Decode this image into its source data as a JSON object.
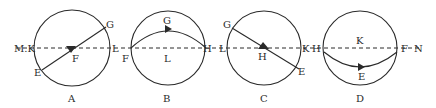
{
  "figure": {
    "panels": [
      {
        "id": "A",
        "caption": "A",
        "cx": 72,
        "cy": 48,
        "r": 38
      },
      {
        "id": "B",
        "caption": "B",
        "cx": 167,
        "cy": 48,
        "r": 37
      },
      {
        "id": "C",
        "caption": "C",
        "cx": 264,
        "cy": 48,
        "r": 37
      },
      {
        "id": "D",
        "caption": "D",
        "cx": 360,
        "cy": 48,
        "r": 37
      }
    ],
    "labels": {
      "A": {
        "left": "M.K",
        "right": "L",
        "top": "G",
        "bottom": "E",
        "center": "F"
      },
      "B": {
        "left": "F",
        "right": "H",
        "top": "G",
        "center": "L",
        "left_outer": "L"
      },
      "C": {
        "left": "H",
        "left2": "L",
        "right": "K",
        "top": "G",
        "bottom": "E",
        "center": "H"
      },
      "D": {
        "left": "H",
        "right": "F",
        "right_outer": "N",
        "center": "K",
        "bottom": "E"
      }
    },
    "line_color": "#2a2a2a",
    "dashed_axis": {
      "y": 48,
      "x_start": 14,
      "x_end": 420
    }
  }
}
